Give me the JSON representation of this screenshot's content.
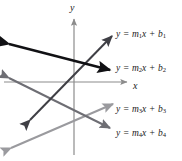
{
  "figure": {
    "type": "coordinate-plane-line-diagram",
    "background": "#ffffff",
    "width": 182,
    "height": 161
  },
  "axes": {
    "x_label": "x",
    "y_label": "y",
    "color": "#8c8c8c",
    "origin": {
      "x": 74,
      "y": 82
    },
    "x_axis": {
      "x1": 4,
      "y1": 82,
      "x2": 127,
      "y2": 82,
      "arrow": "right"
    },
    "y_axis": {
      "x1": 74,
      "y1": 155,
      "x2": 74,
      "y2": 18,
      "arrow": "up"
    }
  },
  "lines": [
    {
      "id": "line1",
      "label_text": "y = m₁x + b₁",
      "label_parts": {
        "y": "y",
        "eq": "=",
        "m": "m",
        "sub": "1",
        "x": "x",
        "plus": "+",
        "b": "b",
        "bsub": "1"
      },
      "color": "#3f3f45",
      "stroke_width": 2.0,
      "slope_sign": "positive",
      "from": {
        "x": 30,
        "y": 120
      },
      "to": {
        "x": 112,
        "y": 36
      },
      "arrows": "both"
    },
    {
      "id": "line2",
      "label_text": "y = m₂x + b₂",
      "label_parts": {
        "y": "y",
        "eq": "=",
        "m": "m",
        "sub": "2",
        "x": "x",
        "plus": "+",
        "b": "b",
        "bsub": "2"
      },
      "color": "#111114",
      "stroke_width": 2.4,
      "slope_sign": "negative",
      "from": {
        "x": 9,
        "y": 44
      },
      "to": {
        "x": 110,
        "y": 70
      },
      "arrows": "both"
    },
    {
      "id": "line3",
      "label_text": "y = m₃x + b₃",
      "label_parts": {
        "y": "y",
        "eq": "=",
        "m": "m",
        "sub": "3",
        "x": "x",
        "plus": "+",
        "b": "b",
        "bsub": "3"
      },
      "color": "#9a9a9e",
      "stroke_width": 2.0,
      "slope_sign": "positive",
      "from": {
        "x": 11,
        "y": 148
      },
      "to": {
        "x": 113,
        "y": 104
      },
      "arrows": "both"
    },
    {
      "id": "line4",
      "label_text": "y = m₄x + b₄",
      "label_parts": {
        "y": "y",
        "eq": "=",
        "m": "m",
        "sub": "4",
        "x": "x",
        "plus": "+",
        "b": "b",
        "bsub": "4"
      },
      "color": "#6e6e74",
      "stroke_width": 2.0,
      "slope_sign": "negative",
      "from": {
        "x": 9,
        "y": 78
      },
      "to": {
        "x": 110,
        "y": 128
      },
      "arrows": "both"
    }
  ]
}
